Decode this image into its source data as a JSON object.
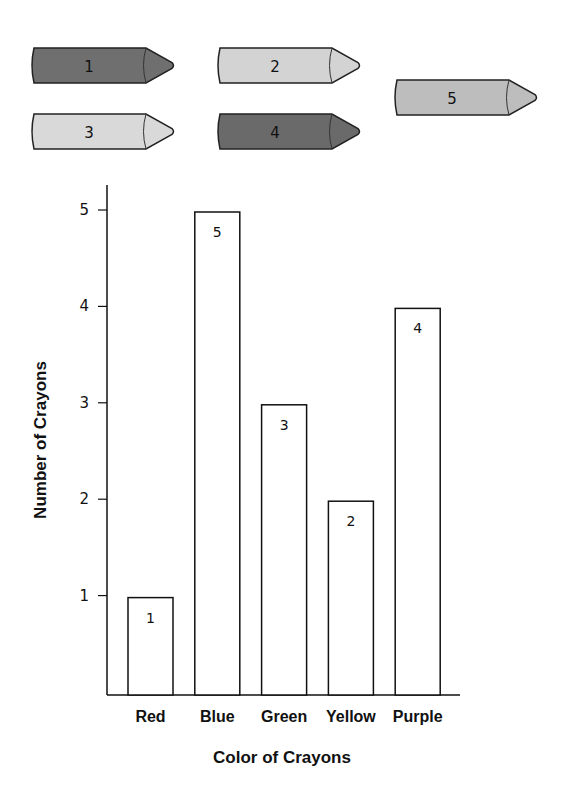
{
  "crayons": [
    {
      "label": "1",
      "shade": "#6f6f6f"
    },
    {
      "label": "2",
      "shade": "#d3d3d3"
    },
    {
      "label": "3",
      "shade": "#d9d9d9"
    },
    {
      "label": "4",
      "shade": "#6a6a6a"
    },
    {
      "label": "5",
      "shade": "#bdbdbd"
    }
  ],
  "chart_data": {
    "type": "bar",
    "title": "",
    "categories": [
      "Red",
      "Blue",
      "Green",
      "Yellow",
      "Purple"
    ],
    "values": [
      1,
      5,
      3,
      2,
      4
    ],
    "data_labels": [
      "1",
      "5",
      "3",
      "2",
      "4"
    ],
    "xlabel": "Color of Crayons",
    "ylabel": "Number of Crayons",
    "yticks": [
      1,
      2,
      3,
      4,
      5
    ],
    "ytick_labels": [
      "1",
      "2",
      "3",
      "4",
      "5"
    ],
    "ylim": [
      0,
      5.3
    ],
    "grid": false,
    "bar_fill": "#ffffff",
    "bar_stroke": "#111111"
  }
}
